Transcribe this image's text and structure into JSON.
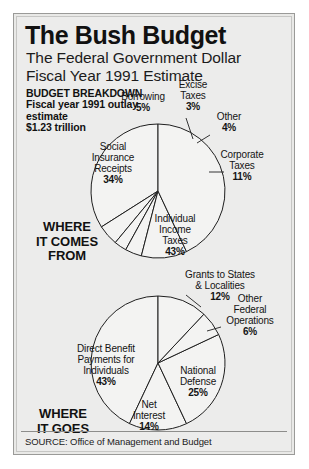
{
  "header": {
    "title": "The Bush Budget",
    "subtitle_line1": "The Federal Government Dollar",
    "subtitle_line2": "Fiscal Year 1991 Estimate",
    "breakdown_heading": "BUDGET BREAKDOWN",
    "breakdown_line1": "Fiscal year 1991 outlay",
    "breakdown_line2": "estimate",
    "breakdown_line3": "$1.23 trillion"
  },
  "sections": {
    "where_it_comes_from": "WHERE\nIT COMES\nFROM",
    "where_it_goes": "WHERE\nIT GOES"
  },
  "source": {
    "text": "SOURCE: Office of Management and Budget"
  },
  "colors": {
    "card_background": "#ececeb",
    "slice_fill": "#f3f3f2",
    "outline": "#1f1f1f",
    "text": "#141414"
  },
  "labels": {
    "receipts": {
      "social_insurance_name": "Social\nInsurance\nReceipts",
      "social_insurance_pct": "34%",
      "individual_income_name": "Individual\nIncome\nTaxes",
      "individual_income_pct": "43%",
      "borrowing_name": "Borrowing",
      "borrowing_pct": "5%",
      "excise_name": "Excise\nTaxes",
      "excise_pct": "3%",
      "other_name": "Other",
      "other_pct": "4%",
      "corporate_name": "Corporate\nTaxes",
      "corporate_pct": "11%"
    },
    "outlays": {
      "direct_benefit_name": "Direct Benefit\nPayments for\nIndividuals",
      "direct_benefit_pct": "43%",
      "national_defense_name": "National\nDefense",
      "national_defense_pct": "25%",
      "net_interest_name": "Net\nInterest",
      "net_interest_pct": "14%",
      "grants_name": "Grants to States\n& Localities",
      "grants_pct": "12%",
      "other_federal_name": "Other\nFederal\nOperations",
      "other_federal_pct": "6%"
    }
  },
  "chart_data": [
    {
      "type": "pie",
      "title": "Where It Comes From",
      "subtitle": "Federal receipts, fiscal year 1991 estimate",
      "unit": "percent",
      "categories": [
        "Individual Income Taxes",
        "Social Insurance Receipts",
        "Corporate Taxes",
        "Borrowing",
        "Other",
        "Excise Taxes"
      ],
      "values": [
        43,
        34,
        11,
        5,
        4,
        3
      ],
      "legend": "labels with leader lines",
      "center": [
        157,
        190
      ],
      "radius": 67
    },
    {
      "type": "pie",
      "title": "Where It Goes",
      "subtitle": "Federal outlays, fiscal year 1991 estimate",
      "unit": "percent",
      "categories": [
        "Direct Benefit Payments for Individuals",
        "National Defense",
        "Net Interest",
        "Grants to States & Localities",
        "Other Federal Operations"
      ],
      "values": [
        43,
        25,
        14,
        12,
        6
      ],
      "legend": "labels with leader lines",
      "center": [
        157,
        362
      ],
      "radius": 67
    }
  ]
}
